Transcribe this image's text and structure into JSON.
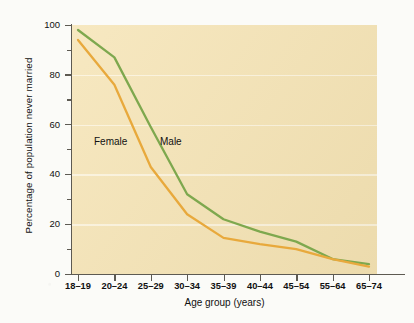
{
  "chart_data": {
    "type": "line",
    "title": "",
    "xlabel": "Age group (years)",
    "ylabel": "Percentage of population never married",
    "categories": [
      "18–19",
      "20–24",
      "25–29",
      "30–34",
      "35–39",
      "40–44",
      "45–54",
      "55–64",
      "65–74"
    ],
    "ylim": [
      0,
      100
    ],
    "yticks": [
      0,
      20,
      40,
      60,
      80,
      100
    ],
    "yticks_minor": [
      10,
      30,
      50,
      70,
      90
    ],
    "grid": true,
    "legend_position": "inline",
    "series": [
      {
        "name": "Male",
        "color": "#7ea84e",
        "values": [
          98,
          87,
          59,
          32,
          22,
          17,
          13,
          6,
          4
        ]
      },
      {
        "name": "Female",
        "color": "#e8a93c",
        "values": [
          94,
          76,
          43,
          24,
          14.5,
          12,
          10,
          6,
          3
        ]
      }
    ],
    "annotations": [
      {
        "text": "Female",
        "series": "Female"
      },
      {
        "text": "Male",
        "series": "Male"
      }
    ]
  },
  "axis": {
    "y_title": "Percentage of population never married",
    "x_title": "Age group (years)",
    "y_tick_labels": [
      "100",
      "80",
      "60",
      "40",
      "20",
      "0"
    ],
    "x_tick_labels": [
      "18–19",
      "20–24",
      "25–29",
      "30–34",
      "35–39",
      "40–44",
      "45–54",
      "55–64",
      "65–74"
    ]
  },
  "labels": {
    "female": "Female",
    "male": "Male"
  },
  "colors": {
    "plot_background": "#f5e3b3",
    "page_background": "#fbfbf8",
    "male_line": "#7ea84e",
    "female_line": "#e8a93c",
    "axis": "#5d5a52",
    "gridline": "#fdf6e2"
  }
}
